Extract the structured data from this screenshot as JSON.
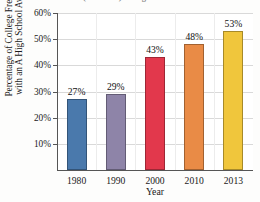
{
  "chart_data": {
    "type": "bar",
    "title": "(A− to A+) in High School",
    "title_cropped": true,
    "categories": [
      "1980",
      "1990",
      "2000",
      "2010",
      "2013"
    ],
    "values": [
      27,
      29,
      43,
      48,
      53
    ],
    "value_labels": [
      "27%",
      "29%",
      "43%",
      "48%",
      "53%"
    ],
    "xlabel": "Year",
    "ylabel_line1": "Percentage of College Freshmen",
    "ylabel_line2": "with an A High School Average",
    "ylim": [
      0,
      60
    ],
    "ytick_values": [
      10,
      20,
      30,
      40,
      50,
      60
    ],
    "ytick_labels": [
      "10%",
      "20%",
      "30%",
      "40%",
      "50%",
      "60%"
    ],
    "grid": true,
    "legend": null,
    "bar_colors": [
      "#4A79AC",
      "#8E84A8",
      "#E2384C",
      "#E98B46",
      "#F0C63C"
    ],
    "axis_color": "#555555",
    "gridline_color": "#D9D9D9"
  }
}
